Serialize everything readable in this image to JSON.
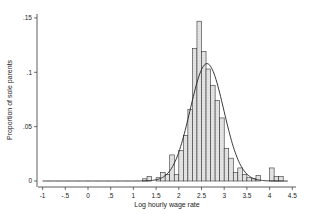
{
  "chart_data": {
    "type": "bar",
    "subtype": "histogram_with_normal_density",
    "title": "",
    "xlabel": "Log hourly wage rate",
    "ylabel": "Proportion of sole parents",
    "xlim": [
      -1.1,
      4.6
    ],
    "ylim": [
      0,
      0.15
    ],
    "x_ticks": [
      -1,
      -0.5,
      0,
      0.5,
      1,
      1.5,
      2,
      2.5,
      3,
      3.5,
      4,
      4.5
    ],
    "x_tick_labels": [
      "-1",
      "-.5",
      "0",
      ".5",
      "1",
      "1.5",
      "2",
      "2.5",
      "3",
      "3.5",
      "4",
      "4.5"
    ],
    "y_ticks": [
      0,
      0.05,
      0.1,
      0.15
    ],
    "y_tick_labels": [
      "0",
      ".05",
      ".1",
      ".15"
    ],
    "grid": false,
    "legend": null,
    "bin_width": 0.1,
    "bins": [
      {
        "start": 1.2,
        "value": 0.002
      },
      {
        "start": 1.3,
        "value": 0.004
      },
      {
        "start": 1.4,
        "value": 0.0
      },
      {
        "start": 1.5,
        "value": 0.003
      },
      {
        "start": 1.6,
        "value": 0.008
      },
      {
        "start": 1.7,
        "value": 0.006
      },
      {
        "start": 1.8,
        "value": 0.024
      },
      {
        "start": 1.9,
        "value": 0.006
      },
      {
        "start": 2.0,
        "value": 0.028
      },
      {
        "start": 2.1,
        "value": 0.042
      },
      {
        "start": 2.2,
        "value": 0.066
      },
      {
        "start": 2.3,
        "value": 0.122
      },
      {
        "start": 2.4,
        "value": 0.147
      },
      {
        "start": 2.5,
        "value": 0.119
      },
      {
        "start": 2.6,
        "value": 0.103
      },
      {
        "start": 2.7,
        "value": 0.088
      },
      {
        "start": 2.8,
        "value": 0.074
      },
      {
        "start": 2.9,
        "value": 0.058
      },
      {
        "start": 3.0,
        "value": 0.03
      },
      {
        "start": 3.1,
        "value": 0.021
      },
      {
        "start": 3.2,
        "value": 0.008
      },
      {
        "start": 3.3,
        "value": 0.012
      },
      {
        "start": 3.4,
        "value": 0.006
      },
      {
        "start": 3.5,
        "value": 0.003
      },
      {
        "start": 3.6,
        "value": 0.002
      },
      {
        "start": 3.7,
        "value": 0.005
      },
      {
        "start": 3.8,
        "value": 0.0
      },
      {
        "start": 3.9,
        "value": 0.0
      },
      {
        "start": 4.0,
        "value": 0.012
      },
      {
        "start": 4.1,
        "value": 0.004
      },
      {
        "start": 4.2,
        "value": 0.004
      }
    ],
    "density_curve": {
      "type": "normal",
      "mean": 2.62,
      "sd": 0.37,
      "peak": 0.108,
      "x_range": [
        -1,
        4.4
      ]
    },
    "series": [
      {
        "name": "Histogram",
        "style": "dotted-fill bars"
      },
      {
        "name": "Normal density",
        "style": "solid line"
      }
    ]
  }
}
